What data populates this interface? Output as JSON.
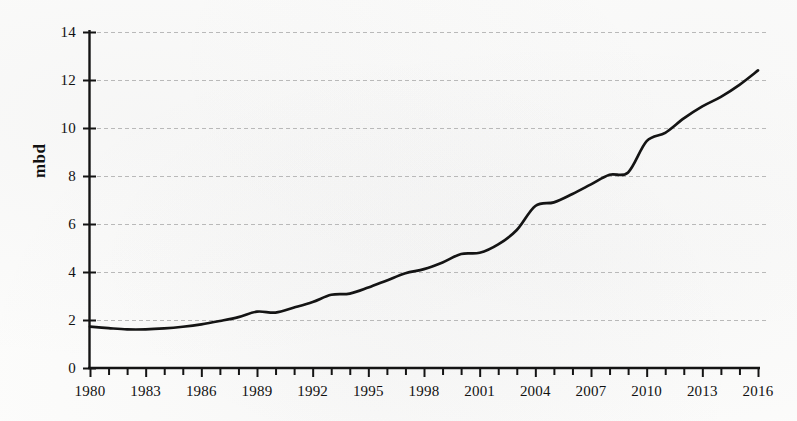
{
  "chart_data": {
    "type": "line",
    "title": "",
    "subtitle": "",
    "xlabel": "",
    "ylabel": "mbd",
    "xlim": [
      1980,
      2016
    ],
    "ylim": [
      0,
      14
    ],
    "ytick_step": 2,
    "xtick_step": 1,
    "xtick_label_step": 3,
    "grid": "horizontal-dashed",
    "legend": "none",
    "annotations": [],
    "ytick_labels": [
      "0",
      "2",
      "4",
      "6",
      "8",
      "10",
      "12",
      "14"
    ],
    "ytick_values": [
      0,
      2,
      4,
      6,
      8,
      10,
      12,
      14
    ],
    "xtick_labels": [
      "1980",
      "1983",
      "1986",
      "1989",
      "1992",
      "1995",
      "1998",
      "2001",
      "2004",
      "2007",
      "2010",
      "2013",
      "2016"
    ],
    "xtick_values": [
      1980,
      1983,
      1986,
      1989,
      1992,
      1995,
      1998,
      2001,
      2004,
      2007,
      2010,
      2013,
      2016
    ],
    "x": [
      1980,
      1981,
      1982,
      1983,
      1984,
      1985,
      1986,
      1987,
      1988,
      1989,
      1990,
      1991,
      1992,
      1993,
      1994,
      1995,
      1996,
      1997,
      1998,
      1999,
      2000,
      2001,
      2002,
      2003,
      2004,
      2005,
      2006,
      2007,
      2008,
      2009,
      2010,
      2011,
      2012,
      2013,
      2014,
      2015,
      2016
    ],
    "series": [
      {
        "name": "mbd",
        "color": "#141414",
        "values": [
          1.72,
          1.66,
          1.61,
          1.61,
          1.65,
          1.72,
          1.82,
          1.96,
          2.12,
          2.35,
          2.31,
          2.52,
          2.75,
          3.05,
          3.1,
          3.35,
          3.65,
          3.95,
          4.12,
          4.4,
          4.75,
          4.8,
          5.15,
          5.75,
          6.75,
          6.9,
          7.25,
          7.65,
          8.05,
          8.15,
          9.45,
          9.8,
          10.4,
          10.9,
          11.3,
          11.8,
          12.4
        ]
      }
    ]
  },
  "axes": {
    "y_axis_name": "mbd-axis",
    "x_axis_name": "year-axis"
  }
}
